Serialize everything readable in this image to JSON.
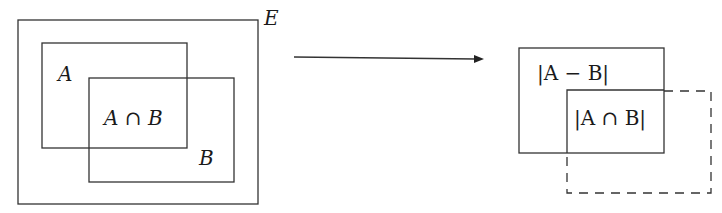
{
  "diagram": {
    "left_panel": {
      "universe_label": "E",
      "set_a_label": "A",
      "set_b_label": "B",
      "intersection_label": "A ∩ B"
    },
    "arrow": {
      "direction": "right",
      "meaning": "maps-to"
    },
    "right_panel": {
      "difference_label": "|A − B|",
      "intersection_label": "|A ∩ B|",
      "dashed_region": "B (outline, dashed)"
    },
    "colors": {
      "stroke": "#333333",
      "background": "#ffffff"
    }
  }
}
